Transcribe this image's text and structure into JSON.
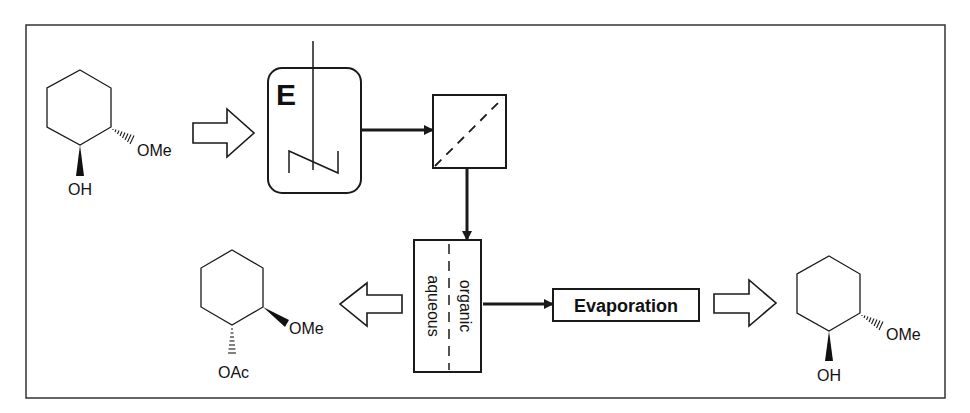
{
  "diagram": {
    "type": "process-flow",
    "colors": {
      "stroke": "#1a1a1a",
      "background": "#ffffff"
    },
    "starting_material": {
      "substituent_1": "OMe",
      "substituent_2": "OH",
      "stereo_omE": "hashed",
      "stereo_oh": "wedge"
    },
    "reactor": {
      "label": "E",
      "icon": "stirred-tank-reactor-icon"
    },
    "filter": {
      "icon": "filter-icon"
    },
    "separator": {
      "phase_left": "aqueous",
      "phase_right": "organic",
      "icon": "liquid-liquid-separator-icon"
    },
    "evaporation": {
      "label": "Evaporation"
    },
    "product_acetate": {
      "substituent_1": "OMe",
      "substituent_2": "OAc",
      "stereo_ome": "wedge",
      "stereo_oac": "hashed"
    },
    "product_alcohol": {
      "substituent_1": "OMe",
      "substituent_2": "OH",
      "stereo_ome": "hashed",
      "stereo_oh": "wedge"
    }
  }
}
